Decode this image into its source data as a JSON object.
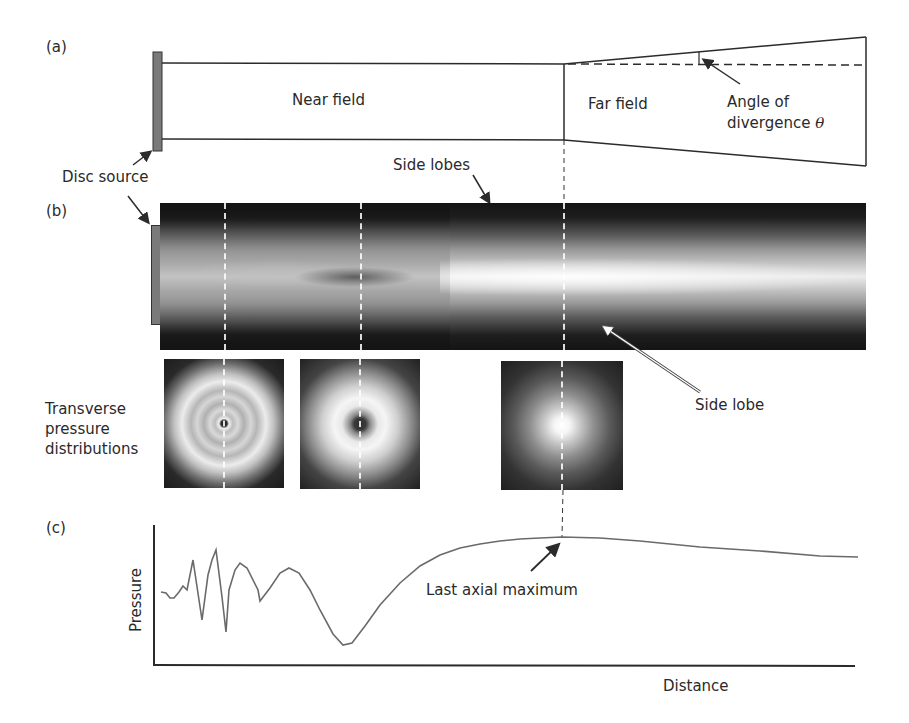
{
  "panels": {
    "a": {
      "letter": "(a)",
      "near_field_label": "Near field",
      "far_field_label": "Far field",
      "angle_label_line1": "Angle of",
      "angle_label_line2": "divergence",
      "angle_symbol": "θ",
      "disc_source_label": "Disc source"
    },
    "b": {
      "letter": "(b)",
      "disc_source_label": "Disc source",
      "side_lobes_label": "Side lobes",
      "side_lobe_label": "Side lobe",
      "transverse_label_line1": "Transverse",
      "transverse_label_line2": "pressure",
      "transverse_label_line3": "distributions"
    },
    "c": {
      "letter": "(c)",
      "ylabel": "Pressure",
      "xlabel": "Distance",
      "annotation": "Last axial maximum"
    }
  },
  "colors": {
    "line": "#2b2b2b",
    "curve": "#6a6a6a",
    "source": "#7a7a7a",
    "beam_dark": "#1c1c1c",
    "beam_bright": "#f5f5f5"
  },
  "chart_data": {
    "type": "line",
    "title": "",
    "xlabel": "Distance",
    "ylabel": "Pressure",
    "grid": false,
    "annotations": [
      "Last axial maximum"
    ],
    "x": [
      0,
      5,
      9,
      13,
      18,
      22,
      26,
      32,
      41,
      47,
      51,
      55,
      61,
      65,
      68,
      74,
      79,
      86,
      97,
      99,
      109,
      119,
      128,
      138,
      149,
      159,
      172,
      182,
      191,
      204,
      219,
      239,
      259,
      279,
      299,
      319,
      339,
      359,
      379,
      401,
      439,
      479,
      539,
      599,
      659,
      697
    ],
    "y": [
      73,
      72,
      67,
      67,
      73,
      79,
      75,
      105,
      45,
      90,
      105,
      115,
      68,
      33,
      75,
      95,
      102,
      97,
      75,
      64,
      77,
      92,
      97,
      92,
      75,
      55,
      31,
      20,
      22,
      39,
      60,
      82,
      99,
      110,
      117,
      121,
      124,
      126,
      127,
      128,
      127,
      124,
      118,
      114,
      109,
      108
    ],
    "ylim": [
      0,
      140
    ],
    "xlim": [
      0,
      700
    ],
    "last_axial_maximum_x": 401
  }
}
